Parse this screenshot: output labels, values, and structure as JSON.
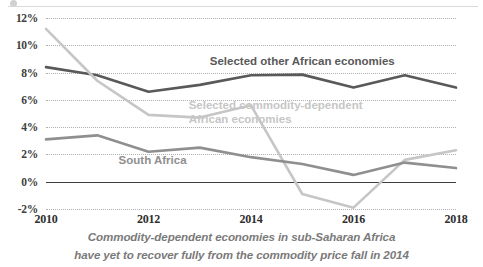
{
  "chart_data": {
    "type": "line",
    "title": "",
    "caption_line1": "Commodity-dependent economies in sub-Saharan Africa",
    "caption_line2": "have yet to recover fully from the commodity price fall in 2014",
    "xlabel": "",
    "ylabel": "",
    "x": [
      2010,
      2011,
      2012,
      2013,
      2014,
      2015,
      2016,
      2017,
      2018
    ],
    "xtick_labels": [
      "2010",
      "2012",
      "2014",
      "2016",
      "2018"
    ],
    "xtick_values": [
      2010,
      2012,
      2014,
      2016,
      2018
    ],
    "ytick_labels": [
      "12%",
      "10%",
      "8%",
      "6%",
      "4%",
      "2%",
      "0%",
      "-2%"
    ],
    "ytick_values": [
      12,
      10,
      8,
      6,
      4,
      2,
      0,
      -2
    ],
    "ylim": [
      -2,
      12
    ],
    "xlim": [
      2010,
      2018
    ],
    "grid": true,
    "grid_style": "dotted-horizontal",
    "legend_position": "inline-annotations",
    "unit": "percent",
    "series": [
      {
        "name": "Selected other African economies",
        "color": "#595959",
        "label_x_pct": 62.5,
        "label_y_pct": 22.5,
        "values": [
          8.4,
          7.8,
          6.6,
          7.1,
          7.8,
          7.85,
          6.9,
          7.8,
          6.9
        ]
      },
      {
        "name": "Selected commodity-dependent African economies",
        "color": "#c6c6c6",
        "label_line1": "Selected commodity-dependent",
        "label_line2": "African economies",
        "label_x_pct": 56.0,
        "label_y_pct": 49.0,
        "values": [
          11.2,
          7.4,
          4.9,
          4.7,
          5.6,
          -0.9,
          -1.9,
          1.6,
          2.3
        ]
      },
      {
        "name": "South Africa",
        "color": "#8f8f8f",
        "label_x_pct": 26.0,
        "label_y_pct": 74.5,
        "values": [
          3.1,
          3.4,
          2.2,
          2.5,
          1.8,
          1.3,
          0.5,
          1.4,
          1.0
        ]
      }
    ],
    "zero_axis": {
      "value": 0,
      "color": "#3f3f3f"
    }
  }
}
